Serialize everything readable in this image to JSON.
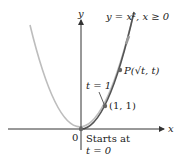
{
  "diagram": {
    "axes": {
      "x_label": "x",
      "y_label": "y",
      "origin_label": "0"
    },
    "curve_label": "y = x², x ≥ 0",
    "point_p_label": "P(√t, t)",
    "point_one_label": "(1, 1)",
    "t_one_label": "t = 1",
    "start_label_line1": "Starts at",
    "start_label_line2": "t = 0",
    "colors": {
      "full_parabola": "#b9b9b9",
      "right_branch": "#555555",
      "axis": "#333333",
      "point": "#666666"
    }
  }
}
